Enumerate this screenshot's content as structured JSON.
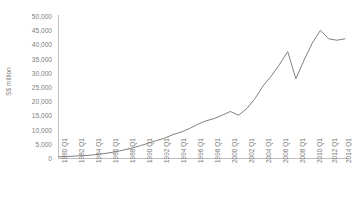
{
  "title": "",
  "axis": {
    "ylabel": "S$ million",
    "yticks": [
      "50,000",
      "45,000",
      "40,000",
      "35,000",
      "30,000",
      "25,000",
      "20,000",
      "15,000",
      "10,000",
      "5,000",
      "0"
    ],
    "xticks": [
      "1980 Q1",
      "1982 Q1",
      "1984 Q1",
      "1986 Q1",
      "1988 Q1",
      "1990 Q1",
      "1992 Q1",
      "1994 Q1",
      "1996 Q1",
      "1998 Q1",
      "2000 Q1",
      "2002 Q1",
      "2004 Q1",
      "2006 Q1",
      "2008 Q1",
      "2010 Q1",
      "2012 Q1",
      "2014 Q1"
    ]
  },
  "colors": {
    "line": "#808080",
    "axis": "#bfbfbf",
    "text": "#7d7d7d",
    "background": "#ffffff"
  },
  "chart_data": {
    "type": "line",
    "title": "",
    "xlabel": "",
    "ylabel": "S$ million",
    "ylim": [
      0,
      50000
    ],
    "grid": false,
    "legend": false,
    "x": [
      "1980 Q1",
      "1981 Q1",
      "1982 Q1",
      "1983 Q1",
      "1984 Q1",
      "1985 Q1",
      "1986 Q1",
      "1987 Q1",
      "1988 Q1",
      "1989 Q1",
      "1990 Q1",
      "1991 Q1",
      "1992 Q1",
      "1993 Q1",
      "1994 Q1",
      "1995 Q1",
      "1996 Q1",
      "1997 Q1",
      "1998 Q1",
      "1999 Q1",
      "2000 Q1",
      "2001 Q1",
      "2002 Q1",
      "2003 Q1",
      "2004 Q1",
      "2005 Q1",
      "2006 Q1",
      "2007 Q1",
      "2008 Q1",
      "2009 Q1",
      "2010 Q1",
      "2011 Q1",
      "2012 Q1",
      "2013 Q1",
      "2014 Q1",
      "2015 Q1"
    ],
    "series": [
      {
        "name": "S$ million",
        "values": [
          600,
          700,
          850,
          1000,
          1200,
          1500,
          1900,
          2400,
          3000,
          3700,
          4500,
          5400,
          6300,
          7200,
          8400,
          9300,
          10500,
          12000,
          13200,
          14000,
          15200,
          16500,
          15200,
          17500,
          21000,
          25500,
          29000,
          33000,
          37500,
          28000,
          34500,
          40500,
          45000,
          42000,
          41500,
          42000
        ]
      }
    ]
  }
}
